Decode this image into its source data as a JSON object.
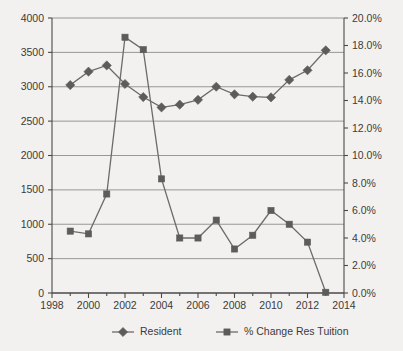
{
  "chart_data": {
    "type": "line",
    "title": "",
    "subtitle": "",
    "xlabel": "",
    "ylabel": "",
    "y2label": "",
    "grid": true,
    "legend_position": "bottom",
    "x": [
      1999,
      2000,
      2001,
      2002,
      2003,
      2004,
      2005,
      2006,
      2007,
      2008,
      2009,
      2010,
      2011,
      2012,
      2013
    ],
    "xlim": [
      1998,
      2014
    ],
    "xticks": [
      1998,
      2000,
      2002,
      2004,
      2006,
      2008,
      2010,
      2012,
      2014
    ],
    "xtick_labels": [
      "1998",
      "2000",
      "2002",
      "2004",
      "2006",
      "2008",
      "2010",
      "2012",
      "2014"
    ],
    "ylim": [
      0,
      4000
    ],
    "yticks": [
      0,
      500,
      1000,
      1500,
      2000,
      2500,
      3000,
      3500,
      4000
    ],
    "ytick_labels": [
      "0",
      "500",
      "1000",
      "1500",
      "2000",
      "2500",
      "3000",
      "3500",
      "4000"
    ],
    "y2lim": [
      0,
      20
    ],
    "y2ticks": [
      0,
      2,
      4,
      6,
      8,
      10,
      12,
      14,
      16,
      18,
      20
    ],
    "y2tick_labels": [
      "0.0%",
      "2.0%",
      "4.0%",
      "6.0%",
      "8.0%",
      "10.0%",
      "12.0%",
      "14.0%",
      "16.0%",
      "18.0%",
      "20.0%"
    ],
    "series": [
      {
        "name": "Resident",
        "axis": "left",
        "marker": "diamond",
        "color": "#5c5c5c",
        "values": [
          3025,
          3220,
          3310,
          3040,
          2850,
          2700,
          2740,
          2810,
          3000,
          2890,
          2855,
          2845,
          3100,
          3240,
          3530
        ]
      },
      {
        "name": "% Change Res Tuition",
        "axis": "right",
        "marker": "square",
        "color": "#5c5c5c",
        "values": [
          4.5,
          4.3,
          7.2,
          18.6,
          17.7,
          8.3,
          4.0,
          4.0,
          5.3,
          3.2,
          4.2,
          6.0,
          5.0,
          3.7,
          0.05
        ]
      }
    ],
    "legend": [
      {
        "label": "Resident",
        "marker": "diamond"
      },
      {
        "label": "% Change Res Tuition",
        "marker": "square"
      }
    ],
    "colors": {
      "background": "#f3f1ef",
      "axis": "#4a4a4a",
      "grid": "#8d8d8d",
      "series": "#5c5c5c",
      "text": "#3b3b3b"
    }
  }
}
